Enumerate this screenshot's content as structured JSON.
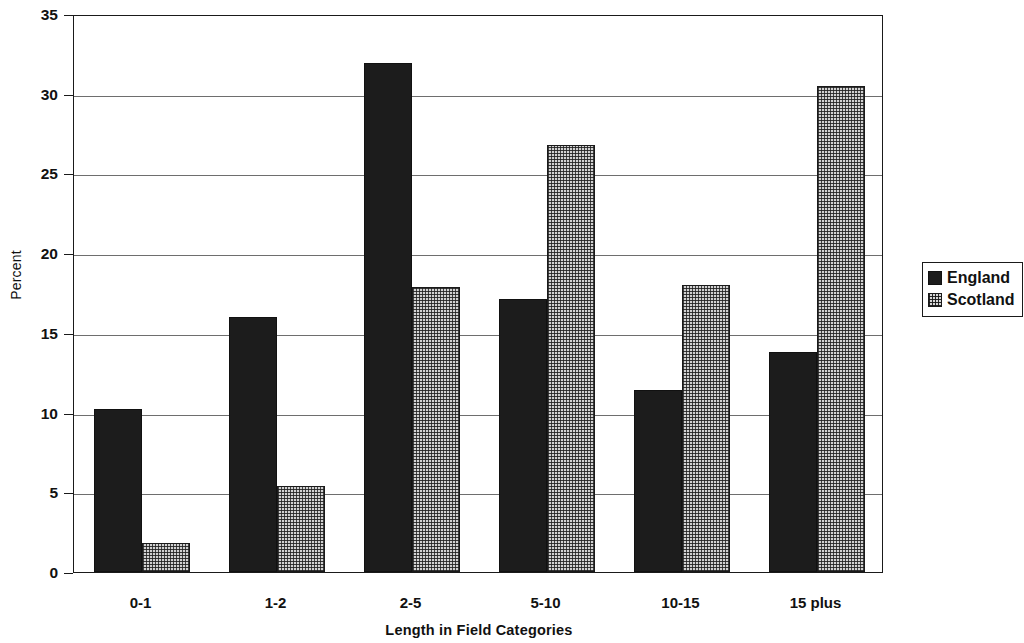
{
  "chart_data": {
    "type": "bar",
    "title": "",
    "xlabel": "Length in Field Categories",
    "ylabel": "Percent",
    "categories": [
      "0-1",
      "1-2",
      "2-5",
      "5-10",
      "10-15",
      "15 plus"
    ],
    "series": [
      {
        "name": "England",
        "color": "#1c1c1c",
        "fill": "solid",
        "values": [
          10.2,
          16.0,
          31.9,
          17.1,
          11.4,
          13.8
        ]
      },
      {
        "name": "Scotland",
        "color": "#d2d2d2",
        "fill": "dotted",
        "values": [
          1.8,
          5.4,
          17.9,
          26.8,
          18.0,
          30.5
        ]
      }
    ],
    "ylim": [
      0,
      35
    ],
    "yticks": [
      0,
      5,
      10,
      15,
      20,
      25,
      30,
      35
    ],
    "ytick_labels": [
      "0",
      "5",
      "10",
      "15",
      "20",
      "25",
      "30",
      "35"
    ],
    "grid": true,
    "grid_axis": "y",
    "legend_position": "right"
  },
  "legend": {
    "entries": [
      {
        "label": "England",
        "swatch": "solid-black-swatch"
      },
      {
        "label": "Scotland",
        "swatch": "dotted-pattern-swatch"
      }
    ]
  }
}
